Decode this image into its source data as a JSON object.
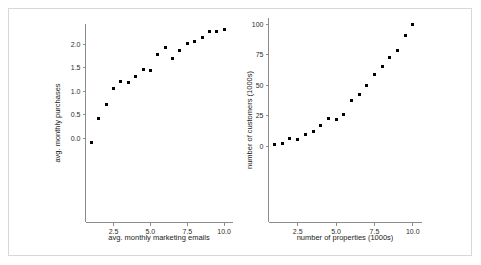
{
  "figure": {
    "background_color": "#ffffff",
    "border_color": "#d8d8d8",
    "marker_color": "#000000",
    "axis_color": "#8c8c8c"
  },
  "chart_data": [
    {
      "type": "scatter",
      "title": "",
      "xlabel": "avg. monthly marketing emails",
      "ylabel": "avg. monthly purchases",
      "xlim": [
        0.6,
        10.6
      ],
      "ylim": [
        -0.25,
        2.45
      ],
      "grid": false,
      "legend": null,
      "xticks": [
        2.5,
        5.0,
        7.5,
        10.0
      ],
      "xticklabels": [
        "2.5",
        "5.0",
        "7.5",
        "10.0"
      ],
      "yticks": [
        0.0,
        0.5,
        1.0,
        1.5,
        2.0
      ],
      "yticklabels": [
        "0.0",
        "0.5",
        "1.0",
        "1.5",
        "2.0"
      ],
      "x": [
        1.0,
        1.5,
        2.0,
        2.5,
        3.0,
        3.5,
        4.0,
        4.5,
        5.0,
        5.5,
        6.0,
        6.5,
        7.0,
        7.5,
        8.0,
        8.5,
        9.0,
        9.5,
        10.0
      ],
      "y": [
        -0.09,
        0.41,
        0.71,
        1.06,
        1.2,
        1.19,
        1.31,
        1.45,
        1.43,
        1.78,
        1.92,
        1.69,
        1.87,
        2.01,
        2.06,
        2.14,
        2.26,
        2.27,
        2.31
      ]
    },
    {
      "type": "scatter",
      "title": "",
      "xlabel": "number of properties (1000s)",
      "ylabel": "number of customers (1000s)",
      "xlim": [
        0.6,
        10.6
      ],
      "ylim": [
        -6,
        108
      ],
      "grid": false,
      "legend": null,
      "xticks": [
        2.5,
        5.0,
        7.5,
        10.0
      ],
      "xticklabels": [
        "2.5",
        "5.0",
        "7.5",
        "10.0"
      ],
      "yticks": [
        0,
        25,
        50,
        75,
        100
      ],
      "yticklabels": [
        "0",
        "25",
        "50",
        "75",
        "100"
      ],
      "x": [
        1.0,
        1.5,
        2.0,
        2.5,
        3.0,
        3.5,
        4.0,
        4.5,
        5.0,
        5.5,
        6.0,
        6.5,
        7.0,
        7.5,
        8.0,
        8.5,
        9.0,
        9.5,
        10.0
      ],
      "y": [
        1.2,
        2.2,
        5.8,
        5.7,
        9.2,
        11.8,
        17.2,
        22.2,
        21.6,
        25.9,
        37.0,
        42.3,
        49.5,
        58.3,
        65.2,
        72.6,
        78.1,
        90.8,
        99.6
      ]
    }
  ]
}
